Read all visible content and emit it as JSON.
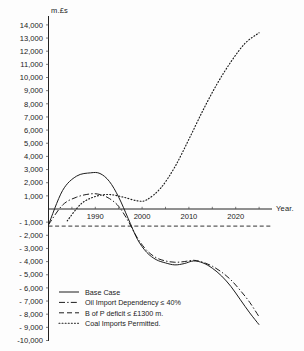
{
  "chart_data": {
    "type": "line",
    "title": "",
    "xlabel": "Year.",
    "ylabel": "m.£s",
    "xlim": [
      1980,
      2027
    ],
    "ylim": [
      -10000,
      14500
    ],
    "grid": false,
    "legend_position": "bottom-left",
    "x_ticks": [
      1990,
      2000,
      2010,
      2020
    ],
    "x_tick_labels": [
      "1990",
      "2000",
      "2010",
      "2020"
    ],
    "y_ticks": [
      14000,
      13000,
      12000,
      11000,
      10000,
      9000,
      8000,
      7000,
      6000,
      5000,
      4000,
      3000,
      2000,
      1000,
      -1000,
      -2000,
      -3000,
      -4000,
      -5000,
      -6000,
      -7000,
      -8000,
      -9000,
      -10000
    ],
    "y_tick_labels": [
      "14,000",
      "13,000",
      "12,000",
      "11,000",
      "10,000",
      "9,000",
      "8,000",
      "7,000",
      "6,000",
      "5,000",
      "4,000",
      "3,000",
      "2,000",
      "1,000",
      "- 1,000",
      "- 2,000",
      "- 3,000",
      "- 4,000",
      "- 5,000",
      "- 6,000",
      "- 7,000",
      "- 8,000",
      "- 9,000",
      "-10,000"
    ],
    "reference_lines": [
      {
        "name": "b-of-p-deficit-limit",
        "orientation": "horizontal",
        "value": -1300,
        "style": "dashed"
      },
      {
        "name": "zero-axis",
        "orientation": "horizontal",
        "value": 0,
        "style": "solid"
      }
    ],
    "series": [
      {
        "name": "Base Case",
        "style": "solid",
        "x": [
          1980,
          1983,
          1986,
          1989,
          1991,
          1993,
          1995,
          1997,
          1999,
          2001,
          2003,
          2005,
          2007,
          2009,
          2011,
          2013,
          2015,
          2017,
          2019,
          2021,
          2023,
          2025
        ],
        "values": [
          -1200,
          1400,
          2500,
          2750,
          2700,
          2100,
          900,
          -700,
          -2300,
          -3300,
          -3850,
          -4100,
          -4250,
          -4150,
          -3950,
          -4100,
          -4500,
          -5100,
          -5900,
          -6900,
          -7900,
          -8800
        ]
      },
      {
        "name": "Oil Import Dependency ≤ 40%",
        "style": "dashdot",
        "x": [
          1980,
          1983,
          1986,
          1989,
          1991,
          1993,
          1995,
          1997,
          1999,
          2001,
          2003,
          2005,
          2007,
          2009,
          2011,
          2013,
          2015,
          2017,
          2019,
          2021,
          2023,
          2025
        ],
        "values": [
          -1200,
          300,
          900,
          1150,
          1100,
          800,
          200,
          -900,
          -2200,
          -3150,
          -3700,
          -3950,
          -4050,
          -4000,
          -3900,
          -4050,
          -4350,
          -4800,
          -5400,
          -6200,
          -7100,
          -8200
        ]
      },
      {
        "name": "B of P deficit ≤ £1300 m.",
        "style": "dashed",
        "x": [
          1980,
          2027
        ],
        "values": [
          -1300,
          -1300
        ]
      },
      {
        "name": "Coal Imports Permitted",
        "style": "dotted",
        "x": [
          1984,
          1987,
          1990,
          1993,
          1996,
          1999,
          2001,
          2004,
          2007,
          2010,
          2013,
          2016,
          2019,
          2022,
          2025
        ],
        "values": [
          -900,
          400,
          950,
          1100,
          900,
          620,
          700,
          1600,
          3200,
          5300,
          7500,
          9500,
          11200,
          12600,
          13400
        ]
      }
    ]
  },
  "legend": {
    "items": [
      {
        "label": "Base Case",
        "style": "solid"
      },
      {
        "label": "Oil Import Dependency ≤ 40%",
        "style": "dashdot"
      },
      {
        "label": "B of P deficit ≤ £1300 m.",
        "style": "dashed"
      },
      {
        "label": "Coal Imports  Permitted.",
        "style": "dotted"
      }
    ]
  },
  "colors": {
    "ink": "#1c1c1c",
    "background": "#fdfdfd"
  }
}
